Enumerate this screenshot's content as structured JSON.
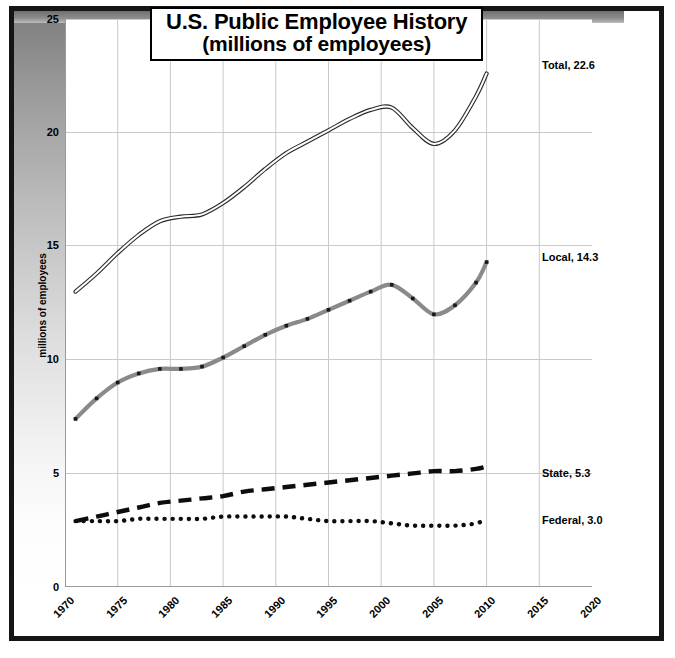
{
  "chart_data": {
    "type": "line",
    "title": "U.S. Public Employee History",
    "subtitle": "(millions of employees)",
    "xlabel": "",
    "ylabel": "millions of employees",
    "xlim": [
      1970,
      2020
    ],
    "ylim": [
      0,
      25
    ],
    "xticks": [
      "1970",
      "1975",
      "1980",
      "1985",
      "1990",
      "1995",
      "2000",
      "2005",
      "2010",
      "2015",
      "2020"
    ],
    "yticks": [
      "0",
      "5",
      "10",
      "15",
      "20",
      "25"
    ],
    "grid": true,
    "legend": "end-of-line labels",
    "x": [
      1971,
      1973,
      1975,
      1977,
      1979,
      1981,
      1983,
      1985,
      1987,
      1989,
      1991,
      1993,
      1995,
      1997,
      1999,
      2001,
      2003,
      2005,
      2007,
      2009,
      2010
    ],
    "series": [
      {
        "name": "Total",
        "end_label": "Total, 22.6",
        "end_value": 22.6,
        "style": "double-line",
        "color": "#2a2a2a",
        "values": [
          13.0,
          13.8,
          14.7,
          15.5,
          16.1,
          16.3,
          16.4,
          16.9,
          17.6,
          18.4,
          19.1,
          19.6,
          20.1,
          20.6,
          21.0,
          21.1,
          20.2,
          19.5,
          20.1,
          21.6,
          22.6
        ]
      },
      {
        "name": "Local",
        "end_label": "Local, 14.3",
        "end_value": 14.3,
        "style": "solid-thick-gray",
        "color": "#8a8a8a",
        "values": [
          7.4,
          8.3,
          9.0,
          9.4,
          9.6,
          9.6,
          9.7,
          10.1,
          10.6,
          11.1,
          11.5,
          11.8,
          12.2,
          12.6,
          13.0,
          13.3,
          12.7,
          12.0,
          12.4,
          13.4,
          14.3
        ]
      },
      {
        "name": "State",
        "end_label": "State, 5.3",
        "end_value": 5.3,
        "style": "dashed-black",
        "color": "#0d0d0d",
        "values": [
          2.9,
          3.1,
          3.3,
          3.5,
          3.7,
          3.8,
          3.9,
          4.0,
          4.2,
          4.3,
          4.4,
          4.5,
          4.6,
          4.7,
          4.8,
          4.9,
          5.0,
          5.1,
          5.1,
          5.2,
          5.3
        ]
      },
      {
        "name": "Federal",
        "end_label": "Federal, 3.0",
        "end_value": 3.0,
        "style": "dotted-black",
        "color": "#0d0d0d",
        "values": [
          2.9,
          2.9,
          2.9,
          3.0,
          3.0,
          3.0,
          3.0,
          3.1,
          3.1,
          3.1,
          3.1,
          3.0,
          2.9,
          2.9,
          2.9,
          2.8,
          2.7,
          2.7,
          2.7,
          2.8,
          3.0
        ]
      }
    ]
  },
  "title": {
    "line1": "U.S. Public Employee History",
    "line2": "(millions of employees)"
  },
  "axes": {
    "y_title": "millions of employees",
    "y_ticks": [
      "25",
      "20",
      "15",
      "10",
      "5",
      "0"
    ],
    "x_ticks": [
      "1970",
      "1975",
      "1980",
      "1985",
      "1990",
      "1995",
      "2000",
      "2005",
      "2010",
      "2015",
      "2020"
    ]
  },
  "series_labels": {
    "total": "Total, 22.6",
    "local": "Local, 14.3",
    "state": "State, 5.3",
    "federal": "Federal, 3.0"
  }
}
